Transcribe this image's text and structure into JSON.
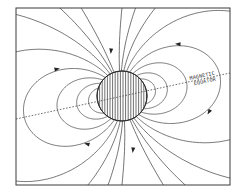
{
  "diagram": {
    "labels": {
      "equator_line1": "MAGNETIC",
      "equator_line2": "EQUATOR"
    },
    "icons": {
      "body": "hatched-sphere",
      "arrows": "field-direction-arrow"
    },
    "colors": {
      "line": "#3a3a3a",
      "background": "#ffffff"
    }
  }
}
